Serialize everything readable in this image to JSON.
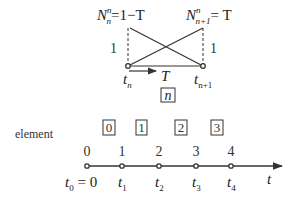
{
  "top": {
    "left_basis": {
      "symbol": "N",
      "sup": "n",
      "sub": "n",
      "rhs": "=1−T"
    },
    "right_basis": {
      "symbol": "N",
      "sup": "n",
      "sub": "n+1",
      "rhs": "= T"
    },
    "left_height_label": "1",
    "right_height_label": "1",
    "left_node": {
      "symbol": "t",
      "sub": "n"
    },
    "right_node": {
      "symbol": "t",
      "sub": "n+1"
    },
    "local_coord_label": "T",
    "element_box": "n"
  },
  "bottom": {
    "row_label": "element",
    "elements": [
      "0",
      "1",
      "2",
      "3"
    ],
    "node_numbers": [
      "0",
      "1",
      "2",
      "3",
      "4"
    ],
    "node_times": [
      {
        "symbol": "t",
        "sub": "0",
        "suffix": " = 0"
      },
      {
        "symbol": "t",
        "sub": "1",
        "suffix": ""
      },
      {
        "symbol": "t",
        "sub": "2",
        "suffix": ""
      },
      {
        "symbol": "t",
        "sub": "3",
        "suffix": ""
      },
      {
        "symbol": "t",
        "sub": "4",
        "suffix": ""
      }
    ],
    "axis_label": "t"
  },
  "colors": {
    "line": "#333333",
    "text": "#222222"
  }
}
